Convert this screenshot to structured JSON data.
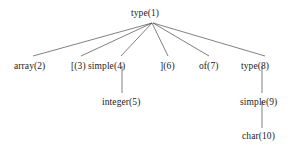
{
  "diagram": {
    "type": "tree",
    "background_color": "#ffffff",
    "line_color": "#4a4a4a",
    "text_color": "#1b1b1b",
    "nodes": [
      {
        "id": "n1",
        "label": "type(1)",
        "number": 1,
        "level": 0,
        "x": 152,
        "y": 22
      },
      {
        "id": "n2",
        "label": "array(2)",
        "number": 2,
        "level": 1,
        "x": 33,
        "y": 57
      },
      {
        "id": "n3",
        "label": "[(3)",
        "number": 3,
        "level": 1,
        "x": 80,
        "y": 57
      },
      {
        "id": "n4",
        "label": "simple(4)",
        "number": 4,
        "level": 1,
        "x": 122,
        "y": 57
      },
      {
        "id": "n5",
        "label": "](6)",
        "number": 6,
        "level": 1,
        "x": 168,
        "y": 57
      },
      {
        "id": "n6",
        "label": "of(7)",
        "number": 7,
        "level": 1,
        "x": 209,
        "y": 57
      },
      {
        "id": "n7",
        "label": "type(8)",
        "number": 8,
        "level": 1,
        "x": 262,
        "y": 57
      },
      {
        "id": "n8",
        "label": "integer(5)",
        "number": 5,
        "level": 2,
        "x": 122,
        "y": 93
      },
      {
        "id": "n9",
        "label": "simple(9)",
        "number": 9,
        "level": 2,
        "x": 262,
        "y": 93
      },
      {
        "id": "n10",
        "label": "char(10)",
        "number": 10,
        "level": 3,
        "x": 262,
        "y": 127
      }
    ],
    "edges": [
      {
        "from": "n1",
        "to": "n2"
      },
      {
        "from": "n1",
        "to": "n3"
      },
      {
        "from": "n1",
        "to": "n4"
      },
      {
        "from": "n1",
        "to": "n5"
      },
      {
        "from": "n1",
        "to": "n6"
      },
      {
        "from": "n1",
        "to": "n7"
      },
      {
        "from": "n4",
        "to": "n8"
      },
      {
        "from": "n7",
        "to": "n9"
      },
      {
        "from": "n9",
        "to": "n10"
      }
    ]
  }
}
